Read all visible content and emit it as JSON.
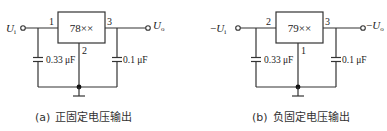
{
  "figures": [
    {
      "id": "a",
      "regulator": "78××",
      "input_label": "U",
      "input_sub": "i",
      "input_sign": "",
      "output_label": "U",
      "output_sub": "o",
      "output_sign": "",
      "pin_in": "1",
      "pin_out": "3",
      "pin_gnd": "2",
      "cap_in": "0.33 μF",
      "cap_out": "0.1 μF",
      "caption_tag": "(a)",
      "caption_text": "正固定电压输出"
    },
    {
      "id": "b",
      "regulator": "79××",
      "input_label": "U",
      "input_sub": "i",
      "input_sign": "−",
      "output_label": "U",
      "output_sub": "o",
      "output_sign": "−",
      "pin_in": "2",
      "pin_out": "3",
      "pin_gnd": "1",
      "cap_in": "0.33 μF",
      "cap_out": "0.1 μF",
      "caption_tag": "(b)",
      "caption_text": "负固定电压输出"
    }
  ],
  "colors": {
    "line": "#333333",
    "background": "#ffffff"
  }
}
